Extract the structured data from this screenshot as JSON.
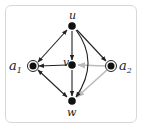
{
  "diagram": {
    "type": "directed-graph",
    "nodes": [
      {
        "id": "u",
        "label": "u",
        "x": 72,
        "y": 26,
        "double": false
      },
      {
        "id": "v",
        "label": "v",
        "x": 72,
        "y": 65,
        "double": false
      },
      {
        "id": "w",
        "label": "w",
        "x": 72,
        "y": 101,
        "double": false
      },
      {
        "id": "a1",
        "label": "a",
        "sub": "1",
        "x": 33,
        "y": 66,
        "double": true
      },
      {
        "id": "a2",
        "label": "a",
        "sub": "2",
        "x": 111,
        "y": 66,
        "double": true
      }
    ],
    "edges": [
      {
        "from": "a1",
        "to": "u",
        "both": true,
        "color": "#222222"
      },
      {
        "from": "u",
        "to": "v",
        "color": "#222222"
      },
      {
        "from": "u",
        "to": "a2",
        "color": "#222222"
      },
      {
        "from": "u",
        "to": "w",
        "curved": true,
        "color": "#222222"
      },
      {
        "from": "v",
        "to": "a1",
        "color": "#222222"
      },
      {
        "from": "a1",
        "to": "w",
        "both": true,
        "color": "#222222"
      },
      {
        "from": "v",
        "to": "w",
        "color": "#222222"
      },
      {
        "from": "a2",
        "to": "v",
        "color": "#bbbbbb"
      },
      {
        "from": "a2",
        "to": "w",
        "color": "#bbbbbb"
      }
    ]
  },
  "labels": {
    "u": "u",
    "v": "v",
    "w": "w",
    "a1": "a",
    "a1_sub": "1",
    "a2": "a",
    "a2_sub": "2"
  }
}
